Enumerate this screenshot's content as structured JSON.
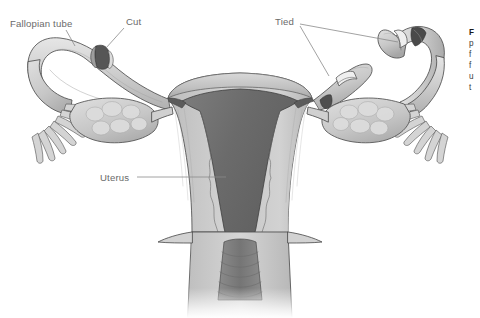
{
  "figure": {
    "background_color": "#ffffff",
    "width": 480,
    "height": 318
  },
  "labels": {
    "fallopian_tube": "Fallopian tube",
    "cut": "Cut",
    "tied": "Tied",
    "uterus": "Uterus"
  },
  "caption": {
    "line1": "F",
    "line2": "p",
    "line3": "f",
    "line4": "f",
    "line5": "u",
    "line6": "t"
  },
  "colors": {
    "outline": "#4f4f4f",
    "tube_fill": "#c9c9c9",
    "tube_highlight": "#dedede",
    "ovary_fill": "#c4c4c4",
    "follicle_fill": "#d6d6d6",
    "myometrium": "#c2c2c2",
    "endometrium_cavity": "#6e6e6e",
    "cervical_canal": "#7a7a7a",
    "ligature": "#e2e2e2",
    "cut_end_dark": "#555555",
    "label_text": "#6a6a6a",
    "leader_line": "#8a8a8a"
  },
  "parts": {
    "left_tube": "left-fallopian-tube",
    "right_tube": "right-fallopian-tube",
    "left_ovary": "left-ovary",
    "right_ovary": "right-ovary",
    "left_fimbriae": "left-fimbriae",
    "right_fimbriae": "right-fimbriae",
    "uterus_body": "uterus-body",
    "uterine_cavity": "uterine-cavity",
    "cervix": "cervix",
    "cervical_canal": "cervical-canal",
    "cut_site": "cut-site-band",
    "tied_stump_left": "tied-stump-medial-left",
    "tied_stump_right": "tied-stump-medial-right"
  }
}
